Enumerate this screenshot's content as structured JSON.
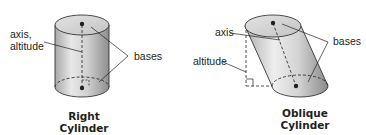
{
  "figures": [
    {
      "id": "right",
      "caption": [
        "Right",
        "Cylinder"
      ],
      "labels": {
        "axis_altitude": [
          "axis,",
          "altitude"
        ],
        "bases": "bases"
      }
    },
    {
      "id": "oblique",
      "caption": [
        "Oblique",
        "Cylinder"
      ],
      "labels": {
        "axis": "axis",
        "altitude": "altitude",
        "bases": "bases"
      }
    }
  ],
  "colors": {
    "stroke": "#231f20",
    "body_light": "#e6e6e6",
    "body_dark": "#9a9a9a",
    "top_face": "#d4d4d4"
  }
}
